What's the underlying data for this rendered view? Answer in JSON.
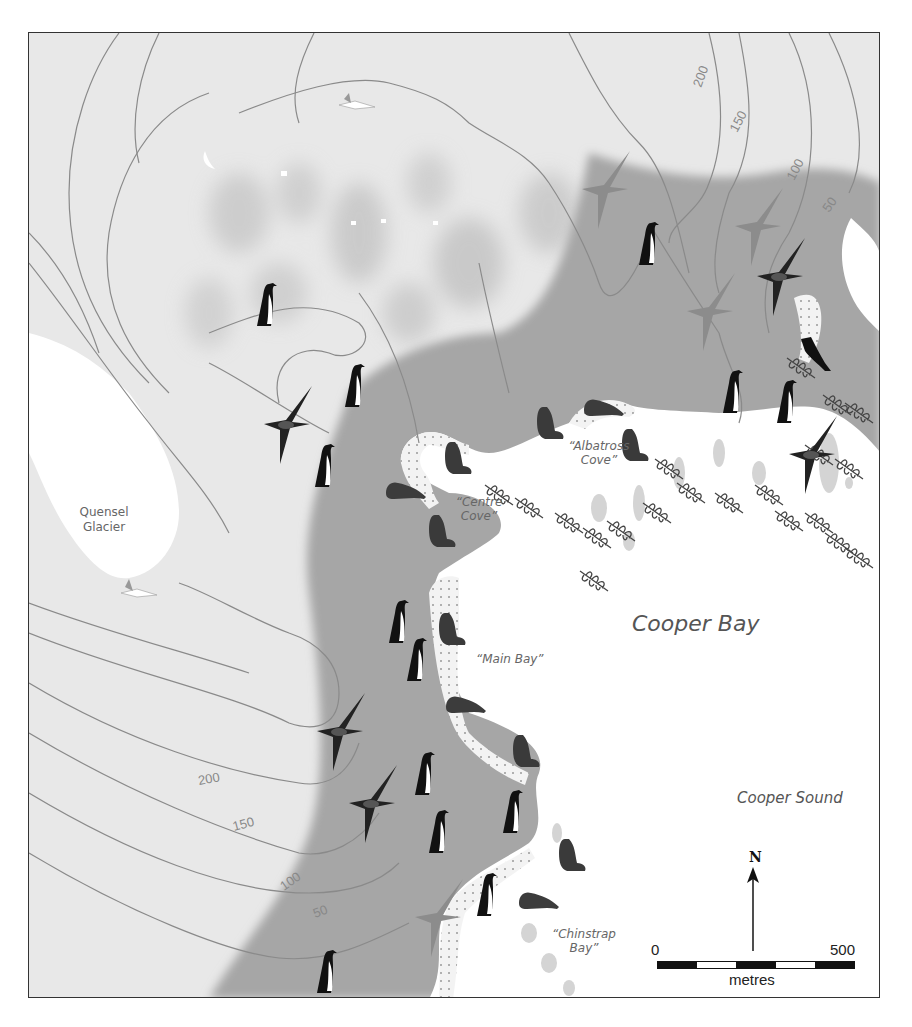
{
  "map": {
    "title": "Cooper Bay",
    "colors": {
      "land_high": "#e6e6e6",
      "land_low": "#a9a9a9",
      "sea": "#ffffff",
      "glacier": "#ffffff",
      "contour": "#8a8a8a",
      "frame": "#333333"
    },
    "places": {
      "bay": "Cooper Bay",
      "sound": "Cooper Sound",
      "glacier_line1": "Quensel",
      "glacier_line2": "Glacier",
      "albatross_cove_line1": "“Albatross",
      "albatross_cove_line2": "Cove”",
      "centre_cove_line1": "“Centre",
      "centre_cove_line2": "Cove”",
      "main_bay": "“Main Bay”",
      "chinstrap_bay_line1": "“Chinstrap",
      "chinstrap_bay_line2": "Bay”"
    },
    "contours": {
      "ne": [
        "200",
        "150",
        "100",
        "50"
      ],
      "sw": [
        "200",
        "150",
        "100",
        "50"
      ]
    },
    "north_arrow": {
      "label": "N"
    },
    "scale": {
      "start": "0",
      "end": "500",
      "unit": "metres",
      "segments": 5
    },
    "wildlife_icons": {
      "penguins": 16,
      "seals": 10,
      "albatrosses": 8,
      "petrels": 3,
      "shag": 1,
      "kelp": 20
    }
  }
}
